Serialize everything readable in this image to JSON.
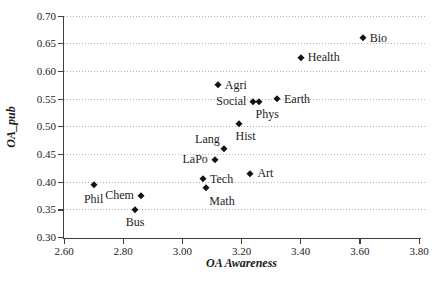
{
  "chart_data": {
    "type": "scatter",
    "title": "",
    "xlabel": "OA Awareness",
    "ylabel": "OA_pub",
    "xlim": [
      2.6,
      3.8
    ],
    "ylim": [
      0.3,
      0.7
    ],
    "x_ticks": [
      2.6,
      2.8,
      3.0,
      3.2,
      3.4,
      3.6,
      3.8
    ],
    "x_tick_labels": [
      "2.60",
      "2.80",
      "3.00",
      "3.20",
      "3.40",
      "3.60",
      "3.80"
    ],
    "y_ticks": [
      0.7,
      0.65,
      0.6,
      0.55,
      0.5,
      0.45,
      0.4,
      0.35,
      0.3
    ],
    "y_tick_labels": [
      "0.70",
      "0.65",
      "0.60",
      "0.55",
      "0.50",
      "0.45",
      "0.40",
      "0.35",
      "0.30"
    ],
    "grid": "horizontal-dotted",
    "legend": "none",
    "marker": {
      "shape": "diamond",
      "size": 5
    },
    "colors": {
      "background": "#ffffff",
      "text": "#1c1c1c",
      "axis": "#3f3f3f",
      "grid": "#b4b4b4",
      "marker": "#141414"
    },
    "points": [
      {
        "label": "Bio",
        "x": 3.61,
        "y": 0.66,
        "label_pos": "right"
      },
      {
        "label": "Health",
        "x": 3.4,
        "y": 0.625,
        "label_pos": "right"
      },
      {
        "label": "Agri",
        "x": 3.12,
        "y": 0.575,
        "label_pos": "right"
      },
      {
        "label": "Earth",
        "x": 3.32,
        "y": 0.55,
        "label_pos": "right"
      },
      {
        "label": "Social",
        "x": 3.24,
        "y": 0.545,
        "label_pos": "left"
      },
      {
        "label": "Phys",
        "x": 3.26,
        "y": 0.545,
        "label_pos": "below",
        "nudge": [
          8,
          0
        ]
      },
      {
        "label": "Hist",
        "x": 3.19,
        "y": 0.505,
        "label_pos": "below",
        "nudge": [
          7,
          0
        ]
      },
      {
        "label": "Lang",
        "x": 3.14,
        "y": 0.46,
        "label_pos": "above-left"
      },
      {
        "label": "LaPo",
        "x": 3.11,
        "y": 0.44,
        "label_pos": "left"
      },
      {
        "label": "Art",
        "x": 3.23,
        "y": 0.415,
        "label_pos": "right"
      },
      {
        "label": "Tech",
        "x": 3.07,
        "y": 0.405,
        "label_pos": "right"
      },
      {
        "label": "Math",
        "x": 3.08,
        "y": 0.39,
        "label_pos": "below",
        "nudge": [
          16,
          1
        ]
      },
      {
        "label": "Phil",
        "x": 2.7,
        "y": 0.395,
        "label_pos": "below",
        "nudge": [
          0,
          2
        ]
      },
      {
        "label": "Chem",
        "x": 2.86,
        "y": 0.375,
        "label_pos": "left"
      },
      {
        "label": "Bus",
        "x": 2.84,
        "y": 0.35,
        "label_pos": "below"
      }
    ]
  }
}
